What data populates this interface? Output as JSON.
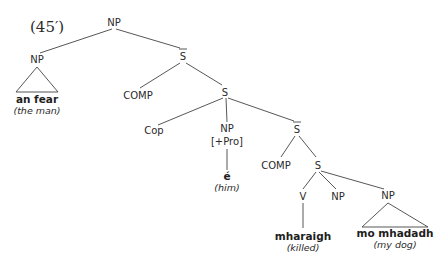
{
  "example_number": "(45′)",
  "nodes": {
    "root": "NP",
    "np_left": "NP",
    "np_left_word": "an fear",
    "np_left_gloss": "(the man)",
    "sbar1": "S",
    "comp1": "COMP",
    "s1": "S",
    "cop": "Cop",
    "np_pro": "NP",
    "np_pro_feature": "[+Pro]",
    "np_pro_word": "é",
    "np_pro_gloss": "(him)",
    "sbar2": "S",
    "comp2": "COMP",
    "s2": "S",
    "v": "V",
    "v_word": "mharaigh",
    "v_gloss": "(killed)",
    "np_mid": "NP",
    "np_right": "NP",
    "np_right_word": "mo mhadadh",
    "np_right_gloss": "(my dog)"
  }
}
